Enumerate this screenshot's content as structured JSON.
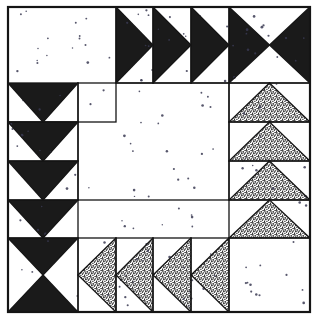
{
  "figure": {
    "name": "quilt-block-diagram",
    "kind": "pieced quilt block line drawing",
    "width": 319,
    "height": 322,
    "background_color": "#ffffff",
    "outline_color": "#151515",
    "fill_black": "#1a1a1a",
    "fill_white": "#ffffff",
    "fill_stipple": "#8c8c8c",
    "border": {
      "x": 8,
      "y": 7,
      "width": 302,
      "height": 305,
      "stroke_width": 2.2
    }
  },
  "grid": {
    "columns": 5,
    "rows": 5,
    "cell_size": 57,
    "origin_x": 8,
    "origin_y": 7,
    "col_edges": [
      8,
      78,
      116,
      153,
      191,
      229,
      310
    ],
    "row_edges": [
      7,
      83,
      122,
      161,
      200,
      238,
      312
    ]
  },
  "patches": [
    {
      "id": "p-corner-tl",
      "name": "plain-square-top-left",
      "unit": "plain-square",
      "fill": "white",
      "col": 0,
      "row": 0,
      "col_span": 2,
      "row_span": 2,
      "note": "large plain white square corner"
    },
    {
      "id": "p-top-1",
      "name": "half-square-triangle-top-1",
      "unit": "half-square-triangle",
      "fill": "black",
      "point": "right",
      "col": 2,
      "row": 0
    },
    {
      "id": "p-top-2",
      "name": "half-square-triangle-top-2",
      "unit": "half-square-triangle",
      "fill": "black",
      "point": "right",
      "col": 3,
      "row": 0
    },
    {
      "id": "p-top-3",
      "name": "half-square-triangle-top-3",
      "unit": "half-square-triangle",
      "fill": "black",
      "point": "right",
      "col": 4,
      "row": 0
    },
    {
      "id": "p-corner-tr",
      "name": "hourglass-top-right",
      "unit": "hourglass",
      "fill": "black",
      "orientation": "horizontal",
      "col": 5,
      "row": 0,
      "note": "left and right triangles black"
    },
    {
      "id": "p-left-1",
      "name": "flying-geese-left-1",
      "unit": "flying-geese",
      "fill": "black",
      "point": "down",
      "col": 0,
      "row": 1
    },
    {
      "id": "p-left-2",
      "name": "flying-geese-left-2",
      "unit": "flying-geese",
      "fill": "black",
      "point": "down",
      "col": 0,
      "row": 2
    },
    {
      "id": "p-left-3",
      "name": "flying-geese-left-3",
      "unit": "flying-geese",
      "fill": "black",
      "point": "down",
      "col": 0,
      "row": 3
    },
    {
      "id": "p-left-4",
      "name": "flying-geese-left-4",
      "unit": "flying-geese",
      "fill": "black",
      "point": "down",
      "col": 0,
      "row": 4
    },
    {
      "id": "p-right-1",
      "name": "flying-geese-right-1",
      "unit": "flying-geese",
      "fill": "stipple",
      "point": "up",
      "col": 5,
      "row": 1
    },
    {
      "id": "p-right-2",
      "name": "flying-geese-right-2",
      "unit": "flying-geese",
      "fill": "stipple",
      "point": "up",
      "col": 5,
      "row": 2
    },
    {
      "id": "p-right-3",
      "name": "flying-geese-right-3",
      "unit": "flying-geese",
      "fill": "stipple",
      "point": "up",
      "col": 5,
      "row": 3
    },
    {
      "id": "p-right-4",
      "name": "flying-geese-right-4",
      "unit": "flying-geese",
      "fill": "stipple",
      "point": "up",
      "col": 5,
      "row": 4
    },
    {
      "id": "p-center",
      "name": "plain-square-center",
      "unit": "plain-square",
      "fill": "white",
      "col": 1,
      "row": 1,
      "col_span": 4,
      "row_span": 3,
      "note": "large open white center"
    },
    {
      "id": "p-corner-bl",
      "name": "hourglass-bottom-left",
      "unit": "hourglass",
      "fill": "black",
      "orientation": "vertical",
      "col": 0,
      "row": 5,
      "note": "top and bottom triangles black"
    },
    {
      "id": "p-bottom-1",
      "name": "flying-geese-bottom-1",
      "unit": "flying-geese",
      "fill": "stipple",
      "point": "left",
      "col": 1,
      "row": 5
    },
    {
      "id": "p-bottom-2",
      "name": "flying-geese-bottom-2",
      "unit": "flying-geese",
      "fill": "stipple",
      "point": "left",
      "col": 2,
      "row": 5
    },
    {
      "id": "p-bottom-3",
      "name": "flying-geese-bottom-3",
      "unit": "flying-geese",
      "fill": "stipple",
      "point": "left",
      "col": 3,
      "row": 5
    },
    {
      "id": "p-bottom-4",
      "name": "flying-geese-bottom-4",
      "unit": "flying-geese",
      "fill": "stipple",
      "point": "left",
      "col": 4,
      "row": 5
    },
    {
      "id": "p-corner-br",
      "name": "plain-square-bottom-right",
      "unit": "plain-square",
      "fill": "white",
      "col": 5,
      "row": 5,
      "col_span": 1,
      "row_span": 1,
      "note": "white square lower right"
    }
  ],
  "texture": {
    "white_speckle": {
      "name": "sparse-dot-speckle",
      "dot_color": "#3a3a52",
      "dot_count": 150,
      "dot_radius": 1.0
    },
    "stipple": {
      "name": "dense-random-stipple",
      "dot_color": "#1f1f1f",
      "density": 0.46
    }
  }
}
